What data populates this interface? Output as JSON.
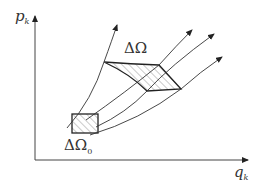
{
  "diagram": {
    "type": "phase-space flow",
    "y_axis": {
      "label": "p",
      "subscript": "k"
    },
    "x_axis": {
      "label": "q",
      "subscript": "k"
    },
    "initial_region": {
      "label": "ΔΩ",
      "subscript": "0"
    },
    "evolved_region": {
      "label": "ΔΩ",
      "subscript": ""
    },
    "trajectories": 4,
    "colors": {
      "line": "#333333",
      "hatch": "#555555",
      "background": "#ffffff"
    }
  }
}
